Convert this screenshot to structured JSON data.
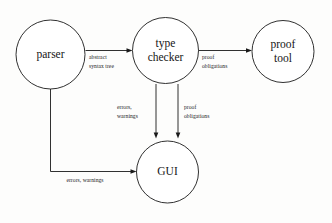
{
  "diagram": {
    "background_color": "#fdfdfc",
    "stroke_color": "#1a1a1a",
    "nodes": [
      {
        "id": "parser",
        "label": "parser",
        "label_line1": "parser",
        "label_line2": ""
      },
      {
        "id": "type-checker",
        "label": "type checker",
        "label_line1": "type",
        "label_line2": "checker"
      },
      {
        "id": "proof-tool",
        "label": "proof tool",
        "label_line1": "proof",
        "label_line2": "tool"
      },
      {
        "id": "gui",
        "label": "GUI",
        "label_line1": "GUI",
        "label_line2": ""
      }
    ],
    "edges": [
      {
        "id": "parser-to-type-checker",
        "from": "parser",
        "to": "type-checker",
        "label": "abstract syntax tree",
        "label_line1": "abstract",
        "label_line2": "syntax tree"
      },
      {
        "id": "type-checker-to-proof-tool",
        "from": "type-checker",
        "to": "proof-tool",
        "label": "proof obligations",
        "label_line1": "proof",
        "label_line2": "obligations"
      },
      {
        "id": "type-checker-to-gui-errors",
        "from": "type-checker",
        "to": "gui",
        "label": "errors, warnings",
        "label_line1": "errors,",
        "label_line2": "warnings"
      },
      {
        "id": "type-checker-to-gui-obligations",
        "from": "type-checker",
        "to": "gui",
        "label": "proof obligations",
        "label_line1": "proof",
        "label_line2": "obligations"
      },
      {
        "id": "parser-to-gui",
        "from": "parser",
        "to": "gui",
        "label": "errors, warnings",
        "label_line1": "errors, warnings",
        "label_line2": ""
      }
    ]
  }
}
